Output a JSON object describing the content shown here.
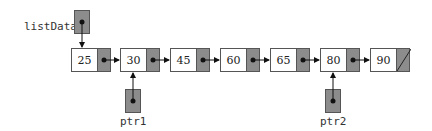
{
  "diagram": {
    "title": "",
    "list_head_label": "listData",
    "nodes": [
      {
        "value": "25",
        "x": 71
      },
      {
        "value": "30",
        "x": 120
      },
      {
        "value": "45",
        "x": 170
      },
      {
        "value": "60",
        "x": 220
      },
      {
        "value": "65",
        "x": 270
      },
      {
        "value": "80",
        "x": 320
      },
      {
        "value": "90",
        "x": 370,
        "null": true
      }
    ],
    "pointers": [
      {
        "label": "ptr1",
        "points_to": "30"
      },
      {
        "label": "ptr2",
        "points_to": "80"
      }
    ],
    "colors": {
      "pointer_fill": "#8c8c8c",
      "border": "#555555"
    }
  }
}
